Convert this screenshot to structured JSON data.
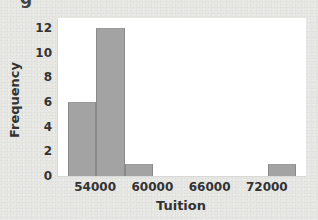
{
  "page": {
    "top_fragment": "g"
  },
  "chart_data": {
    "type": "bar",
    "subtype": "histogram",
    "title": "",
    "xlabel": "Tuition",
    "ylabel": "Frequency",
    "bins": [
      {
        "start": 51000,
        "end": 54000,
        "count": 6
      },
      {
        "start": 54000,
        "end": 57000,
        "count": 12
      },
      {
        "start": 57000,
        "end": 60000,
        "count": 1
      },
      {
        "start": 60000,
        "end": 63000,
        "count": 0
      },
      {
        "start": 63000,
        "end": 66000,
        "count": 0
      },
      {
        "start": 66000,
        "end": 69000,
        "count": 0
      },
      {
        "start": 69000,
        "end": 72000,
        "count": 0
      },
      {
        "start": 72000,
        "end": 75000,
        "count": 1
      }
    ],
    "categories": [
      "51000-54000",
      "54000-57000",
      "57000-60000",
      "60000-63000",
      "63000-66000",
      "66000-69000",
      "69000-72000",
      "72000-75000"
    ],
    "values": [
      6,
      12,
      1,
      0,
      0,
      0,
      0,
      1
    ],
    "xticks": [
      "54000",
      "60000",
      "66000",
      "72000"
    ],
    "yticks": [
      "0",
      "2",
      "4",
      "6",
      "8",
      "10",
      "12"
    ],
    "xlim": [
      50000,
      76000
    ],
    "ylim": [
      0,
      12.8
    ],
    "grid": false,
    "legend": null,
    "colors": {
      "bar_fill": "#a3a3a3",
      "bar_edge": "#8a8a8a",
      "plot_bg": "#ffffff",
      "page_bg": "#e6e6e3"
    }
  }
}
